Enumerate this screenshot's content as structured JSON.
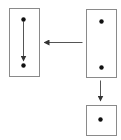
{
  "diagram": {
    "colors": {
      "background": "#ffffff",
      "box_stroke": "#8a8a8a",
      "arrow": "#555555",
      "dot": "#111111"
    },
    "boxes": [
      {
        "id": "left-box",
        "x": 9,
        "y": 8,
        "w": 30,
        "h": 68
      },
      {
        "id": "right-box",
        "x": 86,
        "y": 9,
        "w": 30,
        "h": 68
      },
      {
        "id": "bottom-box",
        "x": 86,
        "y": 105,
        "w": 30,
        "h": 30
      }
    ],
    "dots": [
      {
        "id": "left-top-dot",
        "cx": 23,
        "cy": 19
      },
      {
        "id": "left-bottom-dot",
        "cx": 23,
        "cy": 65
      },
      {
        "id": "right-top-dot",
        "cx": 101,
        "cy": 21
      },
      {
        "id": "right-bottom-dot",
        "cx": 101,
        "cy": 67
      },
      {
        "id": "bottom-dot",
        "cx": 100,
        "cy": 119
      }
    ],
    "arrows": [
      {
        "id": "left-vertical-arrow",
        "x1": 23,
        "y1": 21,
        "x2": 23,
        "y2": 60
      },
      {
        "id": "horizontal-arrow",
        "x1": 82,
        "y1": 42,
        "x2": 44,
        "y2": 42
      },
      {
        "id": "down-arrow",
        "x1": 100,
        "y1": 80,
        "x2": 100,
        "y2": 100
      }
    ]
  }
}
